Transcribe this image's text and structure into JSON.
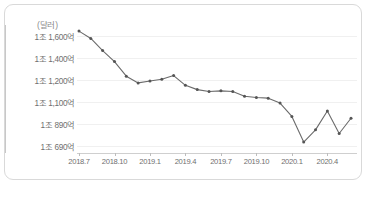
{
  "chart_data": {
    "type": "line",
    "title": "",
    "subtitle": "",
    "unit_label": "(달러)",
    "xlabel": "",
    "ylabel": "",
    "grid": true,
    "legend": "none",
    "x": [
      "2018.7",
      "2018.8",
      "2018.9",
      "2018.10",
      "2018.11",
      "2018.12",
      "2019.1",
      "2019.2",
      "2019.3",
      "2019.4",
      "2019.5",
      "2019.6",
      "2019.7",
      "2019.8",
      "2019.9",
      "2019.10",
      "2019.11",
      "2019.12",
      "2020.1",
      "2020.2",
      "2020.3",
      "2020.4",
      "2020.5",
      "2020.6"
    ],
    "x_tick_labels": [
      "2018.7",
      "2018.10",
      "2019.1",
      "2019.4",
      "2019.7",
      "2019.10",
      "2020.1",
      "2020.4"
    ],
    "y_tick_labels": [
      "1조 1,600억",
      "1조 1,400억",
      "1조 1,200억",
      "1조 1,100억",
      "1조 890억",
      "1조 690억"
    ],
    "y_tick_values": [
      11600,
      11400,
      11200,
      11100,
      10890,
      10690
    ],
    "ylim": [
      10600,
      11650
    ],
    "values": [
      11600,
      11540,
      11440,
      11350,
      11230,
      11175,
      11190,
      11205,
      11235,
      11155,
      11120,
      11105,
      11110,
      11105,
      11065,
      11055,
      11050,
      11010,
      10900,
      10690,
      10790,
      10945,
      10760,
      10885
    ],
    "series_color": "#6b6b6b",
    "marker_color": "#555555",
    "grid_color": "#f0f0f0",
    "axis_color": "#c8c8c8",
    "annotations": []
  },
  "caption": {
    "text": "",
    "truncated": true
  }
}
